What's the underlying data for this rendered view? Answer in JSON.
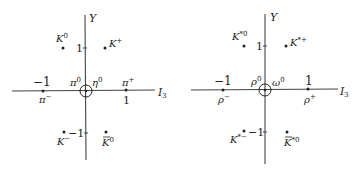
{
  "diagrams": [
    {
      "name": "pseudoscalar-meson-octet",
      "y_axis_label": "Y",
      "x_axis_label": "I",
      "x_axis_sub": "3",
      "tick_pos": "1",
      "tick_neg": "−1",
      "tick_x_neg": "−1",
      "tick_x_pos": "1",
      "particles": {
        "k0": {
          "base": "K",
          "sup": "0"
        },
        "kplus": {
          "base": "K",
          "sup": "+"
        },
        "piminus": {
          "base": "π",
          "sup": "−"
        },
        "piplus": {
          "base": "π",
          "sup": "+"
        },
        "pi0": {
          "base": "π",
          "sup": "0"
        },
        "eta0": {
          "base": "η",
          "sup": "0"
        },
        "kminus": {
          "base": "K",
          "sup": "−"
        },
        "k0bar": {
          "base": "K",
          "sup": "0"
        }
      }
    },
    {
      "name": "vector-meson-octet",
      "y_axis_label": "Y",
      "x_axis_label": "I",
      "x_axis_sub": "3",
      "tick_pos": "1",
      "tick_neg": "−1",
      "tick_x_neg": "−1",
      "tick_x_pos": "1",
      "particles": {
        "kstar0": {
          "base": "K",
          "sup": "*0"
        },
        "kstarplus": {
          "base": "K",
          "sup": "*+"
        },
        "rhominus": {
          "base": "ρ",
          "sup": "−"
        },
        "rhoplus": {
          "base": "ρ",
          "sup": "+"
        },
        "rho0": {
          "base": "ρ",
          "sup": "0"
        },
        "omega0": {
          "base": "ω",
          "sup": "0"
        },
        "kstarminus": {
          "base": "K",
          "sup": "*−"
        },
        "kstar0bar": {
          "base": "K",
          "sup": "*0"
        }
      }
    }
  ]
}
